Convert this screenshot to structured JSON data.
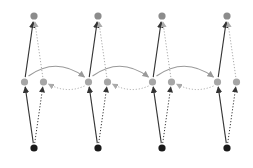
{
  "diagram": {
    "colors": {
      "input_node": "#1a1a1a",
      "hidden_node": "#a6a6a6",
      "output_node": "#8c8c8c",
      "solid_arrow": "#333333",
      "forward_recurrent_arrow": "#9a9a9a",
      "dotted_arrow": "#aaaaaa"
    },
    "timesteps": [
      {
        "index": 1,
        "x": 34
      },
      {
        "index": 2,
        "x": 98
      },
      {
        "index": 3,
        "x": 162
      },
      {
        "index": 4,
        "x": 227
      }
    ],
    "rows": {
      "output_y": 16,
      "hidden_y": 82,
      "input_y": 148
    },
    "hidden_offset": 9.5
  }
}
